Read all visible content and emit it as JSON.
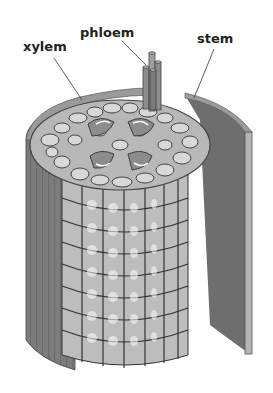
{
  "diagram": {
    "labels": [
      {
        "id": "xylem",
        "text": "xylem",
        "x": 23,
        "y": 40
      },
      {
        "id": "phloem",
        "text": "phloem",
        "x": 80,
        "y": 26
      },
      {
        "id": "stem",
        "text": "stem",
        "x": 197,
        "y": 32
      }
    ],
    "colors": {
      "outer_skin": "#7a7a7a",
      "outer_skin_light": "#9a9a9a",
      "inner_wall": "#6e6e6e",
      "cell_fill": "#cfcfcf",
      "cell_line": "#333333",
      "vascular": "#8c8c8c",
      "flap_edge": "#b5b5b5",
      "label_text": "#222222"
    }
  }
}
